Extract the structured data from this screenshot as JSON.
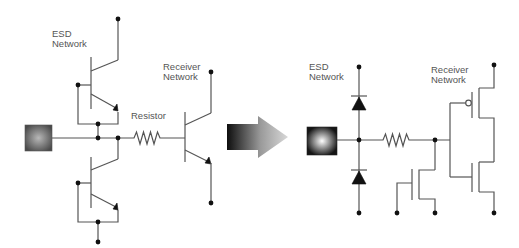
{
  "diagram": {
    "left_circuit": {
      "esd_label": [
        "ESD",
        "Network"
      ],
      "receiver_label": [
        "Receiver",
        "Network"
      ],
      "resistor_label": "Resistor",
      "description": "Bipolar ESD protection: two BJTs clamping pad node, series resistor, BJT receiver"
    },
    "arrow": {
      "direction": "right",
      "gradient": [
        "#111111",
        "#cccccc"
      ]
    },
    "right_circuit": {
      "esd_label": [
        "ESD",
        "Network"
      ],
      "receiver_label": [
        "Receiver",
        "Network"
      ],
      "description": "Diode ESD protection, series resistor, NMOS secondary clamp, CMOS inverter receiver"
    },
    "colors": {
      "wire": "#555555",
      "dot": "#111111",
      "label": "#555555",
      "pad_left": [
        "#b0b0b0",
        "#4a4a4a"
      ],
      "pad_right": [
        "#ffffff",
        "#1a1a1a"
      ]
    }
  }
}
